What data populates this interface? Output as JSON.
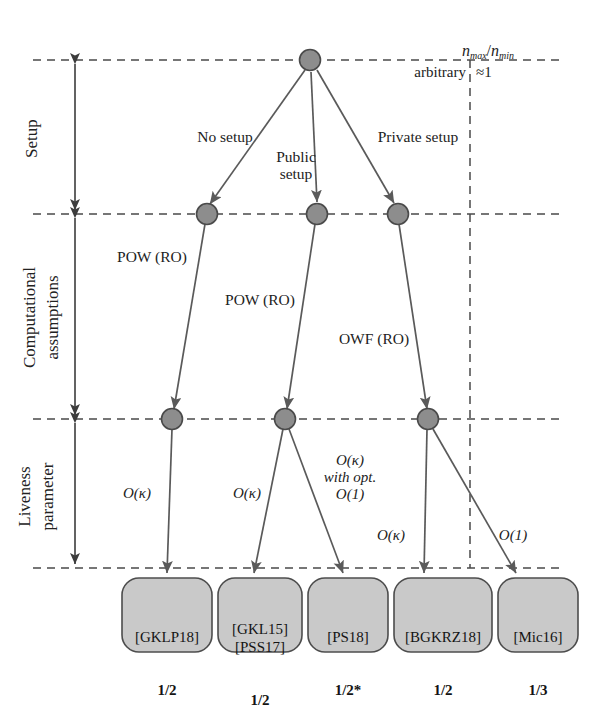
{
  "figure": {
    "type": "hierarchy-diagram",
    "title_top": {
      "ratio_numerator": "n",
      "ratio_sub_max": "max",
      "ratio_sub_min": "min",
      "left_value": "arbitrary",
      "right_value": "≈1"
    },
    "colors": {
      "node_fill": "#8d8d8d",
      "node_stroke": "#4a4a4a",
      "box_fill": "#c9c9c9",
      "box_stroke": "#4d4d4d",
      "line": "#5a5a5a",
      "dash": "#4a4a4a",
      "text": "#1b1b1b"
    }
  },
  "row_labels": [
    {
      "id": "setup",
      "line1": "Setup",
      "line2": ""
    },
    {
      "id": "computational",
      "line1": "Computational",
      "line2": "assumptions"
    },
    {
      "id": "liveness",
      "line1": "Liveness",
      "line2": "parameter"
    }
  ],
  "setup_edges": [
    {
      "id": "no-setup",
      "label": "No setup"
    },
    {
      "id": "public-setup",
      "label": "Public\nsetup"
    },
    {
      "id": "private-setup",
      "label": "Private setup"
    }
  ],
  "assumption_edges": [
    {
      "id": "pow-ro-left",
      "label": "POW (RO)"
    },
    {
      "id": "pow-ro-mid",
      "label": "POW (RO)"
    },
    {
      "id": "owf-ro-right",
      "label": "OWF (RO)"
    }
  ],
  "liveness_edges": [
    {
      "id": "o-kappa-1",
      "label": "O(κ)"
    },
    {
      "id": "o-kappa-2",
      "label": "O(κ)"
    },
    {
      "id": "o-kappa-with-opt",
      "label": "O(κ)\nwith opt.\nO(1)"
    },
    {
      "id": "o-kappa-3",
      "label": "O(κ)"
    },
    {
      "id": "o-one",
      "label": "O(1)"
    }
  ],
  "result_boxes": [
    {
      "id": "gklp18",
      "refs": "[GKLP18]",
      "value": "1/2"
    },
    {
      "id": "gkl15-pss17",
      "refs": "[GKL15]\n[PSS17]",
      "value": "1/2"
    },
    {
      "id": "ps18",
      "refs": "[PS18]",
      "value": "1/2*"
    },
    {
      "id": "bgkrz18",
      "refs": "[BGKRZ18]",
      "value": "1/2"
    },
    {
      "id": "mic16",
      "refs": "[Mic16]",
      "value": "1/3"
    }
  ]
}
